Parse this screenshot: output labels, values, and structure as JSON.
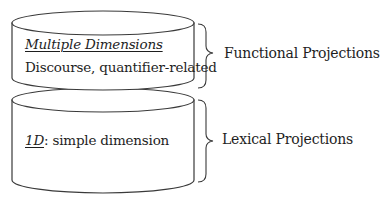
{
  "diagram": {
    "upper_layer": {
      "title": "Multiple Dimensions",
      "description": "Discourse, quantifier-related",
      "projection_label": "Functional Projections"
    },
    "lower_layer": {
      "dimension_label": "1D",
      "separator": ":",
      "description": " simple dimension",
      "projection_label": "Lexical Projections"
    }
  },
  "colors": {
    "stroke": "#3a3a3a",
    "text": "#1e1e1e",
    "background": "#ffffff"
  }
}
